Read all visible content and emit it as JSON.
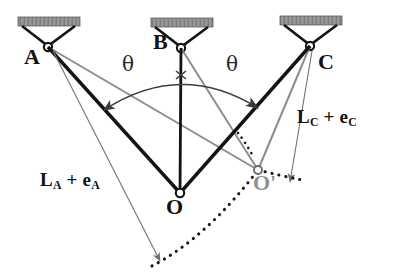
{
  "figure": {
    "background_color": "#ffffff",
    "width": 394,
    "height": 276
  },
  "colors": {
    "line_primary": "#1a1a1a",
    "line_secondary": "#8a8a8a",
    "support_hatch": "#8c8c8c",
    "support_edge": "#4a4a4a",
    "node_fill": "#ffffff",
    "node_stroke": "#1a1a1a",
    "dotted_path": "#1a1a1a",
    "prime_label": "#8f8f8f",
    "text": "#111111"
  },
  "supports": [
    {
      "id": "A",
      "label": "A",
      "pin_x": 48,
      "pin_y": 47,
      "bar_x": 18,
      "bar_y": 17,
      "bar_width": 62,
      "bar_height": 9,
      "label_x": 26,
      "label_y": 50
    },
    {
      "id": "B",
      "label": "B",
      "pin_x": 181,
      "pin_y": 48,
      "bar_x": 151,
      "bar_y": 18,
      "bar_width": 62,
      "bar_height": 9,
      "label_x": 155,
      "label_y": 38
    },
    {
      "id": "C",
      "label": "C",
      "pin_x": 310,
      "pin_y": 46,
      "bar_x": 280,
      "bar_y": 16,
      "bar_width": 62,
      "bar_height": 9,
      "label_x": 318,
      "label_y": 56
    }
  ],
  "nodes": [
    {
      "id": "O",
      "label": "O",
      "x": 180,
      "y": 193,
      "label_x": 168,
      "label_y": 200,
      "style": "original"
    },
    {
      "id": "Oprime",
      "label": "O'",
      "x": 258,
      "y": 170,
      "label_x": 256,
      "label_y": 176,
      "style": "displaced"
    }
  ],
  "cables_original": [
    {
      "from": "A",
      "to": "O",
      "x1": 48,
      "y1": 47,
      "x2": 180,
      "y2": 193,
      "weight": "thick"
    },
    {
      "from": "B",
      "to": "O",
      "x1": 181,
      "y1": 48,
      "x2": 180,
      "y2": 193,
      "weight": "thick"
    },
    {
      "from": "C",
      "to": "O",
      "x1": 310,
      "y1": 46,
      "x2": 180,
      "y2": 193,
      "weight": "thick"
    }
  ],
  "cables_displaced": [
    {
      "from": "A",
      "to": "Oprime",
      "x1": 48,
      "y1": 47,
      "x2": 258,
      "y2": 170,
      "weight": "thin"
    },
    {
      "from": "B",
      "to": "Oprime",
      "x1": 181,
      "y1": 48,
      "x2": 258,
      "y2": 170,
      "weight": "thin"
    },
    {
      "from": "C",
      "to": "Oprime",
      "x1": 310,
      "y1": 46,
      "x2": 258,
      "y2": 170,
      "weight": "thin"
    }
  ],
  "dimension_arrows": [
    {
      "id": "LA-arrow",
      "from_support": "A",
      "x1": 52,
      "y1": 50,
      "x2": 160,
      "y2": 262,
      "label": "L_A + e_A"
    },
    {
      "id": "LC-arrow",
      "from_support": "C",
      "x1": 313,
      "y1": 50,
      "x2": 289,
      "y2": 183,
      "label": "L_C + e_C"
    }
  ],
  "labels": {
    "length_a": {
      "main": "L",
      "sub1": "A",
      "operator": " + ",
      "main2": "e",
      "sub2": "A",
      "x": 40,
      "y": 172
    },
    "length_c": {
      "main": "L",
      "sub1": "C",
      "operator": " + ",
      "main2": "e",
      "sub2": "C",
      "x": 296,
      "y": 108
    },
    "theta_left": {
      "text": "θ",
      "x": 122,
      "y": 56
    },
    "theta_right": {
      "text": "θ",
      "x": 226,
      "y": 56
    }
  },
  "angle_arc": {
    "symbol": "θ",
    "description": "double-headed arc spanning angle theta on each side of vertical BO",
    "left_arrow_x": 104,
    "left_arrow_y": 110,
    "right_arrow_x": 258,
    "right_arrow_y": 108,
    "apex_x": 181,
    "apex_y": 76
  },
  "dotted_curve": {
    "description": "arc of motion passing through O-prime",
    "start_x": 152,
    "start_y": 265,
    "mid_x": 230,
    "mid_y": 210,
    "end_x": 300,
    "end_y": 178,
    "style": "dotted"
  }
}
